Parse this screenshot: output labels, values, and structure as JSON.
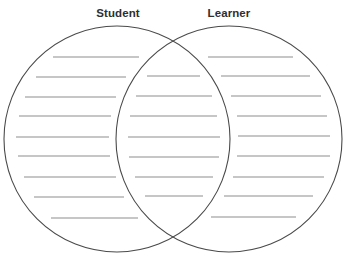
{
  "diagram": {
    "type": "venn",
    "sets": [
      {
        "id": "left",
        "label": "Student",
        "label_x": 118,
        "circle": {
          "cx": 117,
          "cy": 139,
          "r": 113
        }
      },
      {
        "id": "right",
        "label": "Learner",
        "label_x": 229,
        "circle": {
          "cx": 229,
          "cy": 139,
          "r": 113
        }
      }
    ],
    "colors": {
      "circle_stroke": "#4a4a4a",
      "line_stroke": "#8e8e8e",
      "label_text": "#2f2f2f",
      "background": "#ffffff"
    },
    "regions": {
      "left_only": {
        "name": "Student only",
        "lines": [
          {
            "y": 57,
            "x1": 53,
            "x2": 139
          },
          {
            "y": 77,
            "x1": 36,
            "x2": 126
          },
          {
            "y": 97,
            "x1": 25,
            "x2": 116
          },
          {
            "y": 116,
            "x1": 19,
            "x2": 111
          },
          {
            "y": 137,
            "x1": 16,
            "x2": 109
          },
          {
            "y": 156,
            "x1": 18,
            "x2": 110
          },
          {
            "y": 177,
            "x1": 24,
            "x2": 116
          },
          {
            "y": 197,
            "x1": 34,
            "x2": 124
          },
          {
            "y": 218,
            "x1": 51,
            "x2": 138
          }
        ]
      },
      "overlap": {
        "name": "Both",
        "lines": [
          {
            "y": 76,
            "x1": 147,
            "x2": 200
          },
          {
            "y": 96,
            "x1": 136,
            "x2": 212
          },
          {
            "y": 116,
            "x1": 130,
            "x2": 217
          },
          {
            "y": 137,
            "x1": 128,
            "x2": 220
          },
          {
            "y": 157,
            "x1": 129,
            "x2": 219
          },
          {
            "y": 177,
            "x1": 135,
            "x2": 213
          },
          {
            "y": 196,
            "x1": 145,
            "x2": 203
          }
        ]
      },
      "right_only": {
        "name": "Learner only",
        "lines": [
          {
            "y": 57,
            "x1": 208,
            "x2": 293
          },
          {
            "y": 76,
            "x1": 221,
            "x2": 310
          },
          {
            "y": 96,
            "x1": 231,
            "x2": 321
          },
          {
            "y": 116,
            "x1": 237,
            "x2": 327
          },
          {
            "y": 136,
            "x1": 238,
            "x2": 330
          },
          {
            "y": 156,
            "x1": 237,
            "x2": 330
          },
          {
            "y": 177,
            "x1": 233,
            "x2": 324
          },
          {
            "y": 196,
            "x1": 224,
            "x2": 313
          },
          {
            "y": 217,
            "x1": 211,
            "x2": 296
          }
        ]
      }
    }
  }
}
